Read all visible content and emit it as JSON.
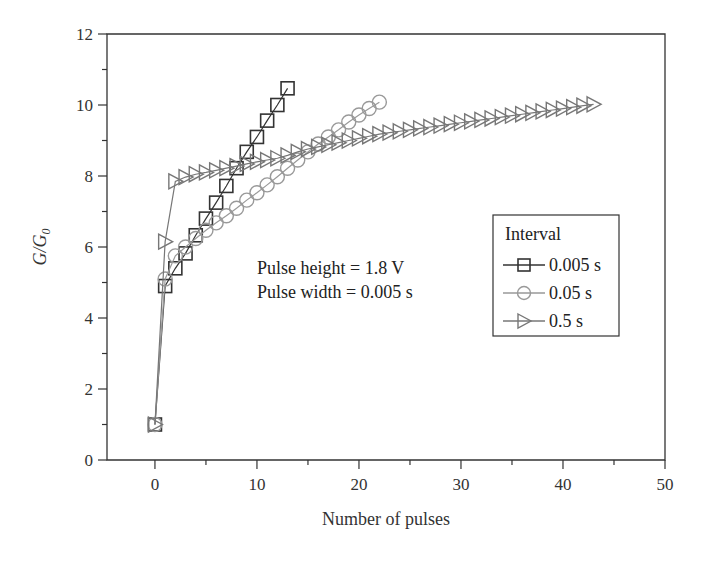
{
  "chart_data": {
    "type": "line",
    "title": "",
    "xlabel": "Number of pulses",
    "ylabel": "G/G0",
    "ylabel_main": "G/G",
    "ylabel_sub": "0",
    "xlim": [
      -4.7,
      50
    ],
    "ylim": [
      0,
      12
    ],
    "xticks": [
      0,
      10,
      20,
      30,
      40,
      50
    ],
    "xtick_labels": [
      "0",
      "10",
      "20",
      "30",
      "40",
      "50"
    ],
    "xminor": [
      -5,
      5,
      15,
      25,
      35,
      45
    ],
    "yticks": [
      0,
      2,
      4,
      6,
      8,
      10,
      12
    ],
    "ytick_labels": [
      "0",
      "2",
      "4",
      "6",
      "8",
      "10",
      "12"
    ],
    "yminor": [
      1,
      3,
      5,
      7,
      9,
      11
    ],
    "grid": false,
    "legend_position": "right-middle",
    "legend_title": "Interval",
    "annotations": [
      "Pulse height = 1.8 V",
      "Pulse width = 0.005 s"
    ],
    "series": [
      {
        "name": "0.005 s",
        "marker": "square",
        "color": "#333333",
        "x": [
          0,
          1,
          2,
          3,
          4,
          5,
          6,
          7,
          8,
          9,
          10,
          11,
          12,
          13
        ],
        "values": [
          1.0,
          4.9,
          5.4,
          5.82,
          6.33,
          6.8,
          7.25,
          7.72,
          8.22,
          8.68,
          9.1,
          9.56,
          10.0,
          10.47
        ]
      },
      {
        "name": "0.05 s",
        "marker": "circle",
        "color": "#999999",
        "x": [
          0,
          1,
          2,
          3,
          4,
          5,
          6,
          7,
          8,
          9,
          10,
          11,
          12,
          13,
          14,
          15,
          16,
          17,
          18,
          19,
          20,
          21,
          22
        ],
        "values": [
          1.0,
          5.1,
          5.75,
          6.0,
          6.24,
          6.47,
          6.68,
          6.88,
          7.09,
          7.32,
          7.53,
          7.75,
          7.98,
          8.22,
          8.45,
          8.68,
          8.9,
          9.1,
          9.3,
          9.52,
          9.72,
          9.9,
          10.08
        ]
      },
      {
        "name": "0.5 s",
        "marker": "triangle-right",
        "color": "#777777",
        "x": [
          0,
          1,
          2,
          3,
          4,
          5,
          6,
          7,
          8,
          9,
          10,
          11,
          12,
          13,
          14,
          15,
          16,
          17,
          18,
          19,
          20,
          21,
          22,
          23,
          24,
          25,
          26,
          27,
          28,
          29,
          30,
          31,
          32,
          33,
          34,
          35,
          36,
          37,
          38,
          39,
          40,
          41,
          42,
          43
        ],
        "values": [
          1.0,
          6.15,
          7.85,
          7.97,
          8.05,
          8.1,
          8.16,
          8.22,
          8.28,
          8.34,
          8.4,
          8.45,
          8.5,
          8.58,
          8.68,
          8.76,
          8.82,
          8.88,
          8.94,
          9.0,
          9.06,
          9.12,
          9.18,
          9.22,
          9.26,
          9.3,
          9.34,
          9.38,
          9.42,
          9.46,
          9.5,
          9.54,
          9.58,
          9.62,
          9.66,
          9.7,
          9.74,
          9.78,
          9.82,
          9.86,
          9.9,
          9.94,
          9.98,
          10.02
        ]
      }
    ]
  }
}
